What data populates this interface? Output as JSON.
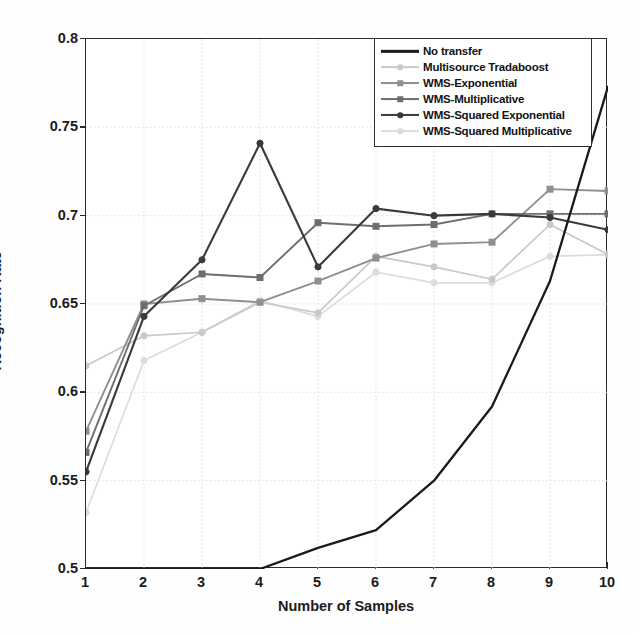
{
  "chart_data": {
    "type": "line",
    "title": "",
    "xlabel": "Number of Samples",
    "ylabel": "Recognition Rate",
    "xlim": [
      1,
      10
    ],
    "ylim": [
      0.5,
      0.8
    ],
    "xticks": [
      "1",
      "2",
      "3",
      "4",
      "5",
      "6",
      "7",
      "8",
      "9",
      "10"
    ],
    "yticks": [
      "0.5",
      "0.55",
      "0.6",
      "0.65",
      "0.7",
      "0.75",
      "0.8"
    ],
    "grid": true,
    "legend_position": "top-right",
    "x": [
      1,
      2,
      3,
      4,
      5,
      6,
      7,
      8,
      9,
      10
    ],
    "series": [
      {
        "name": "No transfer",
        "color": "#1a1a1a",
        "marker": "none",
        "linewidth": 2.3,
        "values": [
          0.5,
          0.5,
          0.5,
          0.5,
          0.512,
          0.522,
          0.55,
          0.592,
          0.663,
          0.773
        ]
      },
      {
        "name": "Multisource Tradaboost",
        "color": "#c9c9c9",
        "marker": "circle",
        "linewidth": 1.7,
        "values": [
          0.615,
          0.632,
          0.634,
          0.651,
          0.645,
          0.677,
          0.671,
          0.664,
          0.695,
          0.678
        ]
      },
      {
        "name": "WMS-Exponential",
        "color": "#8f8f8f",
        "marker": "square",
        "linewidth": 1.9,
        "values": [
          0.578,
          0.65,
          0.653,
          0.651,
          0.663,
          0.676,
          0.684,
          0.685,
          0.715,
          0.714
        ]
      },
      {
        "name": "WMS-Multiplicative",
        "color": "#6e6e6e",
        "marker": "square",
        "linewidth": 1.9,
        "values": [
          0.566,
          0.649,
          0.667,
          0.665,
          0.696,
          0.694,
          0.695,
          0.701,
          0.701,
          0.701
        ]
      },
      {
        "name": "WMS-Squared Exponential",
        "color": "#3a3a3a",
        "marker": "circle",
        "linewidth": 2.1,
        "values": [
          0.555,
          0.643,
          0.675,
          0.741,
          0.671,
          0.704,
          0.7,
          0.701,
          0.699,
          0.692
        ]
      },
      {
        "name": "WMS-Squared Multiplicative",
        "color": "#dcdcdc",
        "marker": "circle",
        "linewidth": 1.7,
        "values": [
          0.532,
          0.618,
          0.634,
          0.652,
          0.643,
          0.668,
          0.662,
          0.662,
          0.677,
          0.678
        ]
      }
    ]
  }
}
